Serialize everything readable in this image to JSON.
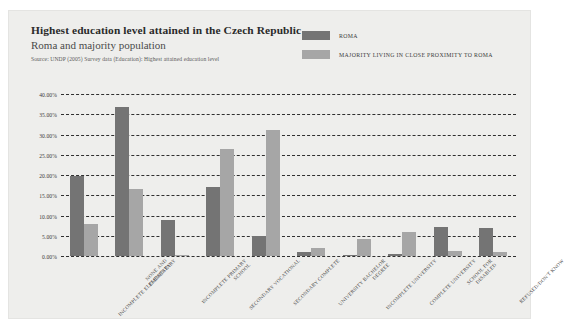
{
  "header": {
    "title": "Highest education level attained in the Czech Republic",
    "subtitle": "Roma and majority population",
    "source": "Source: UNDP (2005) Survey data (Education): Highest attained education level"
  },
  "legend": {
    "position": "top-right",
    "items": [
      {
        "label": "ROMA",
        "color": "#747474"
      },
      {
        "label": "MAJORITY LIVING IN CLOSE PROXIMITY TO ROMA",
        "color": "#a6a6a6"
      }
    ]
  },
  "chart_data": {
    "type": "bar",
    "title": "Highest education level attained in the Czech Republic",
    "subtitle": "Roma and majority population",
    "xlabel": "",
    "ylabel": "",
    "ylim": [
      0,
      40
    ],
    "grid": true,
    "legend_position": "top-right",
    "ytick_labels": [
      "40.00%",
      "35.00%",
      "30.00%",
      "25.00%",
      "20.00%",
      "15.00%",
      "10.00%",
      "5.00%",
      "0.00%"
    ],
    "ytick_values": [
      40,
      35,
      30,
      25,
      20,
      15,
      10,
      5,
      0
    ],
    "categories": [
      "NONE AND INCOMPLETE ELEMENTARY",
      "ELEMENTARY",
      "INCOMPLETE PRIMARY SCHOOL",
      "SECONDARY VOCATIONAL",
      "SECONDARY COMPLETE",
      "UNIVERSITY BACHELOR DEGREE",
      "INCOMPLETE UNIVERSITY",
      "COMPLETE UNIVERSITY",
      "SCHOOL FOR DISABLED",
      "REFUSED/DON'T KNOW"
    ],
    "series": [
      {
        "name": "ROMA",
        "color": "#747474",
        "values": [
          19.8,
          36.8,
          9.0,
          17.0,
          5.0,
          0.9,
          0.3,
          0.5,
          7.2,
          6.8
        ]
      },
      {
        "name": "MAJORITY LIVING IN CLOSE PROXIMITY TO ROMA",
        "color": "#a6a6a6",
        "values": [
          8.0,
          16.5,
          0.3,
          26.5,
          31.0,
          1.9,
          4.2,
          6.0,
          1.3,
          1.0
        ]
      }
    ]
  }
}
